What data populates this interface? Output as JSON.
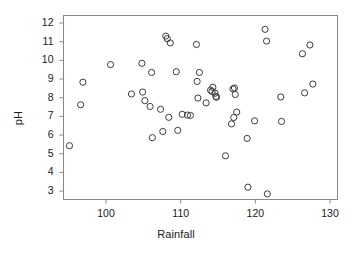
{
  "chart_data": {
    "type": "scatter",
    "title": "",
    "xlabel": "Rainfall",
    "ylabel": "pH",
    "xlim": [
      94.3,
      131.0
    ],
    "ylim": [
      2.55,
      12.4
    ],
    "xticks": [
      100,
      110,
      120,
      130
    ],
    "yticks": [
      3,
      4,
      5,
      6,
      7,
      8,
      9,
      10,
      11,
      12
    ],
    "grid": false,
    "legend": null,
    "marker": "open-circle",
    "marker_color": "#3c3c3c",
    "n_points": 60,
    "points": [
      {
        "x": 95.1,
        "y": 5.43
      },
      {
        "x": 96.6,
        "y": 7.62
      },
      {
        "x": 96.9,
        "y": 8.83
      },
      {
        "x": 100.6,
        "y": 9.77
      },
      {
        "x": 103.4,
        "y": 8.2
      },
      {
        "x": 104.8,
        "y": 9.84
      },
      {
        "x": 104.9,
        "y": 8.3
      },
      {
        "x": 105.2,
        "y": 7.84
      },
      {
        "x": 105.9,
        "y": 7.53
      },
      {
        "x": 106.1,
        "y": 9.35
      },
      {
        "x": 106.2,
        "y": 5.86
      },
      {
        "x": 107.3,
        "y": 7.38
      },
      {
        "x": 107.6,
        "y": 6.19
      },
      {
        "x": 108.0,
        "y": 11.3
      },
      {
        "x": 108.2,
        "y": 11.16
      },
      {
        "x": 108.4,
        "y": 6.95
      },
      {
        "x": 108.6,
        "y": 10.93
      },
      {
        "x": 109.4,
        "y": 9.39
      },
      {
        "x": 109.6,
        "y": 6.25
      },
      {
        "x": 110.2,
        "y": 7.11
      },
      {
        "x": 110.9,
        "y": 7.07
      },
      {
        "x": 111.3,
        "y": 7.05
      },
      {
        "x": 112.1,
        "y": 10.85
      },
      {
        "x": 112.2,
        "y": 8.87
      },
      {
        "x": 112.3,
        "y": 7.98
      },
      {
        "x": 112.5,
        "y": 9.35
      },
      {
        "x": 113.4,
        "y": 7.72
      },
      {
        "x": 114.0,
        "y": 8.4
      },
      {
        "x": 114.2,
        "y": 8.33
      },
      {
        "x": 114.3,
        "y": 8.56
      },
      {
        "x": 114.6,
        "y": 8.24
      },
      {
        "x": 114.7,
        "y": 8.07
      },
      {
        "x": 114.8,
        "y": 8.02
      },
      {
        "x": 116.0,
        "y": 4.89
      },
      {
        "x": 116.8,
        "y": 6.6
      },
      {
        "x": 117.0,
        "y": 8.47
      },
      {
        "x": 117.1,
        "y": 6.94
      },
      {
        "x": 117.2,
        "y": 8.52
      },
      {
        "x": 117.3,
        "y": 8.17
      },
      {
        "x": 117.5,
        "y": 7.23
      },
      {
        "x": 118.9,
        "y": 5.82
      },
      {
        "x": 119.0,
        "y": 3.21
      },
      {
        "x": 119.9,
        "y": 6.76
      },
      {
        "x": 121.3,
        "y": 11.66
      },
      {
        "x": 121.5,
        "y": 11.03
      },
      {
        "x": 121.6,
        "y": 2.85
      },
      {
        "x": 123.4,
        "y": 8.04
      },
      {
        "x": 123.5,
        "y": 6.73
      },
      {
        "x": 126.3,
        "y": 10.35
      },
      {
        "x": 126.6,
        "y": 8.26
      },
      {
        "x": 127.3,
        "y": 10.82
      },
      {
        "x": 127.7,
        "y": 8.73
      }
    ]
  },
  "axes": {
    "x_title": "Rainfall",
    "y_title": "pH",
    "x_tick_labels": [
      "100",
      "110",
      "120",
      "130"
    ],
    "y_tick_labels": [
      "3",
      "4",
      "5",
      "6",
      "7",
      "8",
      "9",
      "10",
      "11",
      "12"
    ]
  },
  "style": {
    "frame_color": "#888888",
    "text_color": "#1a1a1a",
    "background": "#ffffff"
  }
}
